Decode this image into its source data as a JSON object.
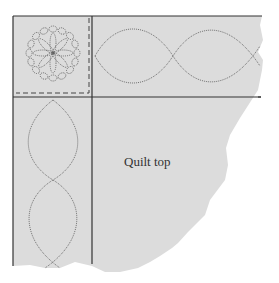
{
  "diagram": {
    "label": "Quilt top",
    "colors": {
      "fabric": "#dcdcdc",
      "background": "#ffffff",
      "line": "#333333",
      "stitch": "#555555"
    },
    "parts": {
      "corner_block": "Corner block with 8-petal flower medallion inside an oval-chain ring and dashed inner border",
      "top_border": "Horizontal border strip with intertwining wave (cable) quilting",
      "left_border": "Vertical border strip with intertwining wave (cable) quilting",
      "quilt_top": "Main quilt top area with irregular torn edge"
    }
  }
}
